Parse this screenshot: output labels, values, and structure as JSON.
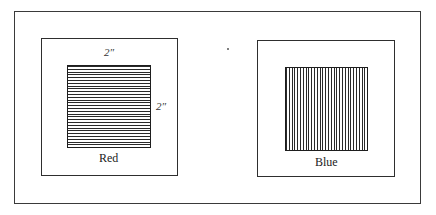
{
  "figure": {
    "panels": [
      {
        "id": "red",
        "label": "Red",
        "hatch": "horizontal",
        "dimensions": {
          "width": "2″",
          "height": "2″"
        }
      },
      {
        "id": "blue",
        "label": "Blue",
        "hatch": "vertical"
      }
    ]
  },
  "colors": {
    "line": "#2a2a2a",
    "background": "#ffffff"
  }
}
